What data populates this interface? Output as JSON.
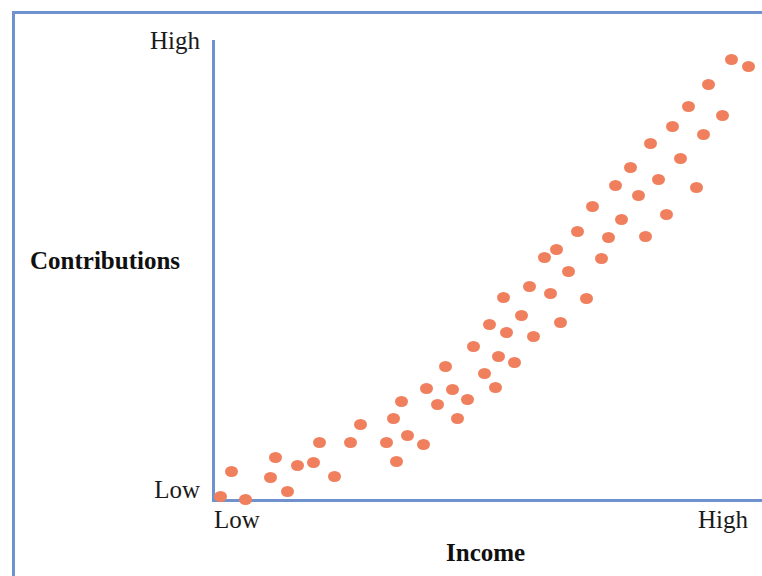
{
  "figure": {
    "background_color": "#ffffff",
    "frame_color": "#7093cf",
    "axis_color": "#6f92ce",
    "marker_color": "#f0805d"
  },
  "axes": {
    "y_title": "Contributions",
    "x_title": "Income",
    "y_ticks": {
      "high": "High",
      "low": "Low"
    },
    "x_ticks": {
      "low": "Low",
      "high": "High"
    }
  },
  "chart_data": {
    "type": "scatter",
    "title": "",
    "xlabel": "Income",
    "ylabel": "Contributions",
    "xlim": [
      0,
      100
    ],
    "ylim": [
      0,
      100
    ],
    "xtick_labels": [
      "Low",
      "High"
    ],
    "ytick_labels": [
      "Low",
      "High"
    ],
    "xtick_positions": [
      0,
      100
    ],
    "ytick_positions": [
      0,
      100
    ],
    "grid": false,
    "legend": null,
    "annotation": "Positive linear association between Income and Contributions",
    "marker_color": "#f0805d",
    "n_points": 62,
    "points": [
      [
        1.5,
        0.7
      ],
      [
        6.0,
        0.1
      ],
      [
        3.5,
        6.2
      ],
      [
        10.6,
        4.9
      ],
      [
        11.5,
        9.3
      ],
      [
        13.8,
        1.8
      ],
      [
        15.5,
        7.4
      ],
      [
        18.5,
        8.2
      ],
      [
        19.5,
        12.5
      ],
      [
        22.2,
        5.1
      ],
      [
        25.2,
        12.6
      ],
      [
        27.0,
        16.5
      ],
      [
        31.8,
        12.4
      ],
      [
        33.0,
        17.8
      ],
      [
        33.5,
        8.4
      ],
      [
        34.5,
        21.4
      ],
      [
        35.6,
        14.1
      ],
      [
        38.5,
        12.1
      ],
      [
        39.0,
        24.2
      ],
      [
        41.0,
        20.8
      ],
      [
        42.5,
        29.1
      ],
      [
        43.8,
        24.1
      ],
      [
        44.6,
        17.8
      ],
      [
        46.5,
        21.8
      ],
      [
        47.5,
        33.4
      ],
      [
        49.5,
        27.5
      ],
      [
        50.5,
        38.2
      ],
      [
        51.5,
        24.4
      ],
      [
        52.0,
        31.2
      ],
      [
        53.0,
        44.1
      ],
      [
        53.5,
        36.4
      ],
      [
        55.0,
        30.0
      ],
      [
        56.3,
        40.2
      ],
      [
        57.8,
        46.4
      ],
      [
        58.5,
        35.6
      ],
      [
        60.5,
        52.8
      ],
      [
        61.6,
        45.0
      ],
      [
        62.7,
        54.5
      ],
      [
        63.4,
        38.5
      ],
      [
        64.8,
        49.7
      ],
      [
        66.5,
        58.4
      ],
      [
        68.0,
        43.7
      ],
      [
        69.2,
        63.8
      ],
      [
        70.8,
        52.6
      ],
      [
        72.0,
        57.1
      ],
      [
        73.3,
        68.3
      ],
      [
        74.5,
        61.0
      ],
      [
        76.0,
        72.2
      ],
      [
        77.5,
        66.1
      ],
      [
        78.8,
        57.2
      ],
      [
        79.8,
        77.5
      ],
      [
        81.2,
        69.6
      ],
      [
        82.6,
        62.1
      ],
      [
        83.8,
        81.2
      ],
      [
        85.2,
        74.3
      ],
      [
        86.6,
        85.6
      ],
      [
        88.0,
        68.0
      ],
      [
        89.4,
        79.5
      ],
      [
        90.2,
        90.4
      ],
      [
        92.8,
        83.5
      ],
      [
        94.5,
        95.7
      ],
      [
        97.5,
        94.3
      ]
    ]
  }
}
